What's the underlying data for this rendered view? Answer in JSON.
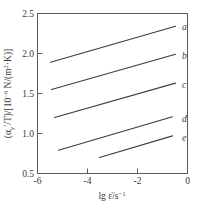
{
  "chart_data": {
    "type": "line",
    "title": "",
    "subtitle": "",
    "xlabel": "lg ε̇/s⁻¹",
    "ylabel": "(αᵧ'/T)/[10⁻⁶ N/(m²·K)]",
    "xlim": [
      -6,
      0
    ],
    "ylim": [
      0.5,
      2.5
    ],
    "xticks": [
      -6,
      -4,
      -2,
      0
    ],
    "xtick_labels": [
      "-6",
      "-4",
      "-2",
      "0"
    ],
    "yticks": [
      0.5,
      1.0,
      1.5,
      2.0,
      2.5
    ],
    "ytick_labels": [
      "0.5",
      "1.0",
      "1.5",
      "2.0",
      "2.5"
    ],
    "grid": false,
    "legend_position": "inline-right",
    "series": [
      {
        "name": "a",
        "label": "a",
        "x": [
          -5.48,
          -0.48
        ],
        "y": [
          1.89,
          2.34
        ]
      },
      {
        "name": "b",
        "label": "b",
        "x": [
          -5.44,
          -0.48
        ],
        "y": [
          1.55,
          1.99
        ]
      },
      {
        "name": "c",
        "label": "c",
        "x": [
          -5.32,
          -0.48
        ],
        "y": [
          1.2,
          1.63
        ]
      },
      {
        "name": "d",
        "label": "d",
        "x": [
          -5.16,
          -0.6
        ],
        "y": [
          0.79,
          1.21
        ]
      },
      {
        "name": "e",
        "label": "e",
        "x": [
          -3.52,
          -0.6
        ],
        "y": [
          0.7,
          0.97
        ]
      }
    ]
  },
  "axis": {
    "y_label_parts": {
      "lead": "(α",
      "sub1": "y",
      "prime": "′/T)/[10",
      "sup1": "−6",
      "tail": " N/(m",
      "sup2": "2",
      "tail2": "·K)]"
    },
    "x_label_parts": {
      "lead": "lg ε̇/s",
      "sup": "−1"
    }
  },
  "style": {
    "line_color": "#3c3c3c",
    "frame_color": "#5a5a5a",
    "text_color": "#3a3a3a",
    "background": "#ffffff"
  }
}
